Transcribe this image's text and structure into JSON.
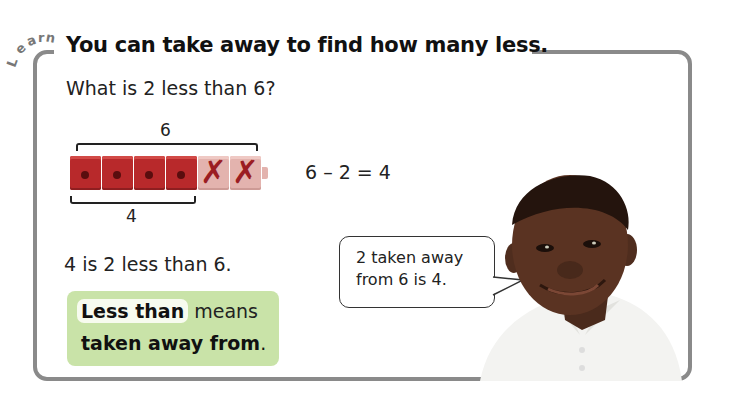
{
  "section_label": "Learn",
  "title": "You can take away to find how many less.",
  "question": "What is 2 less than 6?",
  "model": {
    "total_label": "6",
    "remaining_label": "4",
    "cubes_total": 6,
    "cubes_crossed_out": 2,
    "cube_color": "#b8292b",
    "crossed_cube_color": "#e3b3ae"
  },
  "equation": "6 – 2 = 4",
  "statement": "4 is 2 less than 6.",
  "definition": {
    "term": "Less than",
    "middle": " means",
    "line2": "taken away from",
    "period": ".",
    "box_color": "#c9e3a8"
  },
  "speech_bubble": {
    "line1": "2 taken away",
    "line2": "from 6 is 4."
  },
  "character": "smiling-boy-photo",
  "colors": {
    "frame": "#8a8a8a",
    "text": "#222222"
  }
}
